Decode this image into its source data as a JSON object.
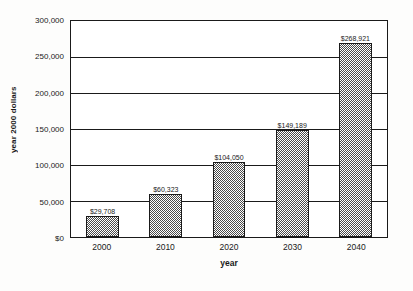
{
  "chart_data": {
    "type": "bar",
    "title": "",
    "xlabel": "year",
    "ylabel": "year 2000 dollars",
    "categories": [
      "2000",
      "2010",
      "2020",
      "2030",
      "2040"
    ],
    "values": [
      29708,
      60323,
      104050,
      149189,
      268921
    ],
    "value_labels": [
      "$29,708",
      "$60,323",
      "$104,050",
      "$149,189",
      "$268,921"
    ],
    "ylim": [
      0,
      300000
    ],
    "ytick_values": [
      0,
      50000,
      100000,
      150000,
      200000,
      250000,
      300000
    ],
    "ytick_labels": [
      "$0",
      "50,000",
      "100,000",
      "150,000",
      "200,000",
      "250,000",
      "300,000"
    ],
    "grid": "horizontal",
    "legend": "none",
    "bar_fill": "checkerboard-hatch",
    "colors": {
      "bar_fill": "#4a4a4a",
      "bar_outline": "#1a1a1a",
      "axis": "#1a1a1a",
      "gridline": "#1a1a1a",
      "background": "#ffffff"
    }
  }
}
